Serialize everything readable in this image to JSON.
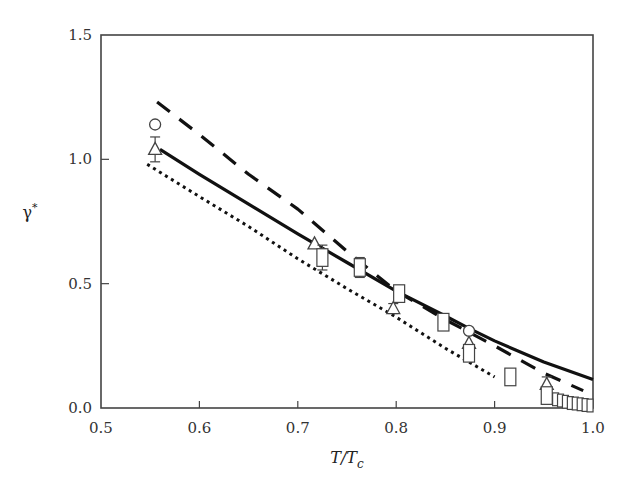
{
  "chart_data": {
    "type": "line",
    "title": "",
    "xlabel": "T/T_c",
    "xlabel_main": "T/T",
    "xlabel_sub": "c",
    "ylabel": "γ*",
    "ylabel_main": "γ",
    "ylabel_sup": "*",
    "xlim": [
      0.5,
      1.0
    ],
    "ylim": [
      0.0,
      1.5
    ],
    "xticks": [
      0.5,
      0.6,
      0.7,
      0.8,
      0.9,
      1.0
    ],
    "xtick_labels": [
      "0.5",
      "0.6",
      "0.7",
      "0.8",
      "0.9",
      "1.0"
    ],
    "yticks": [
      0.0,
      0.5,
      1.0,
      1.5
    ],
    "ytick_labels": [
      "0.0",
      "0.5",
      "1.0",
      "1.5"
    ],
    "grid": false,
    "legend": null,
    "series": [
      {
        "name": "solid-curve",
        "style": "solid",
        "x": [
          0.56,
          0.6,
          0.65,
          0.7,
          0.75,
          0.8,
          0.85,
          0.874,
          0.9,
          0.95,
          1.0
        ],
        "y": [
          1.04,
          0.94,
          0.82,
          0.7,
          0.585,
          0.47,
          0.37,
          0.32,
          0.27,
          0.185,
          0.115
        ]
      },
      {
        "name": "dashed-curve",
        "style": "dashed",
        "x": [
          0.557,
          0.6,
          0.65,
          0.7,
          0.75,
          0.8,
          0.85,
          0.9,
          0.95,
          0.99
        ],
        "y": [
          1.23,
          1.1,
          0.94,
          0.8,
          0.63,
          0.47,
          0.355,
          0.25,
          0.14,
          0.07
        ]
      },
      {
        "name": "dotted-curve",
        "style": "dotted",
        "x": [
          0.547,
          0.6,
          0.65,
          0.7,
          0.75,
          0.8,
          0.85,
          0.9
        ],
        "y": [
          0.98,
          0.85,
          0.73,
          0.6,
          0.48,
          0.365,
          0.24,
          0.125
        ]
      },
      {
        "name": "circles",
        "marker": "circle",
        "x": [
          0.555,
          0.874
        ],
        "y": [
          1.14,
          0.31
        ],
        "yerr": [
          0,
          0
        ]
      },
      {
        "name": "triangles",
        "marker": "triangle",
        "x": [
          0.555,
          0.717,
          0.797,
          0.874,
          0.953
        ],
        "y": [
          1.04,
          0.66,
          0.4,
          0.26,
          0.095
        ],
        "yerr": [
          0.05,
          0,
          0.02,
          0,
          0.03
        ]
      },
      {
        "name": "squares",
        "marker": "square",
        "x": [
          0.725,
          0.763,
          0.803,
          0.848,
          0.874,
          0.916,
          0.953,
          0.962,
          0.967,
          0.972,
          0.977,
          0.982,
          0.987,
          0.992,
          0.997
        ],
        "y": [
          0.605,
          0.565,
          0.46,
          0.345,
          0.22,
          0.125,
          0.05,
          0.035,
          0.03,
          0.025,
          0.02,
          0.018,
          0.015,
          0.012,
          0.01
        ],
        "yerr": [
          0.05,
          0.04,
          0.03,
          0,
          0,
          0,
          0,
          0,
          0,
          0,
          0,
          0,
          0,
          0,
          0
        ]
      }
    ]
  }
}
